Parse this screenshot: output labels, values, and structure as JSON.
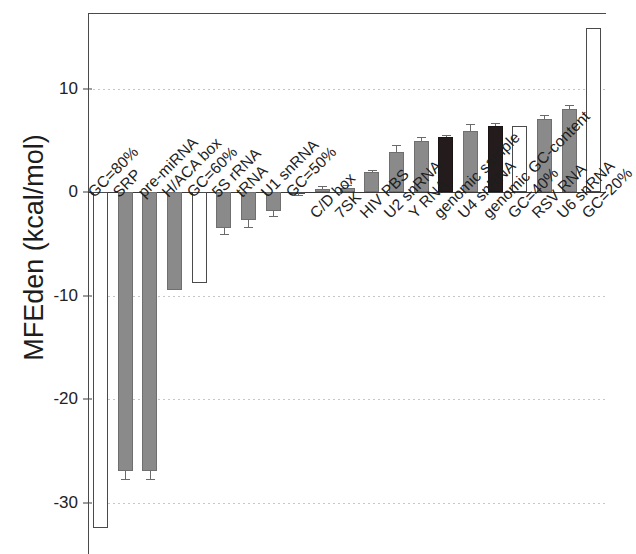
{
  "chart_data": {
    "type": "bar",
    "title": "",
    "xlabel": "",
    "ylabel": "MFEden (kcal/mol)",
    "ylim": [
      -34.5,
      17.4
    ],
    "yticks": [
      10,
      0,
      -10,
      -20,
      -30
    ],
    "ytick_labels": [
      "10",
      "0",
      "-10",
      "-20",
      "-30"
    ],
    "grid": "horizontal dotted gridlines at y ticks",
    "legend": "none",
    "bar_fill_colors": {
      "grey": "#8a8a8a",
      "black": "#241c1c",
      "white": "#ffffff"
    },
    "categories": [
      "GC=80%",
      "SRP",
      "pre-miRNA",
      "H/ACA box",
      "GC=60%",
      "5S rRNA",
      "tRNA",
      "U1 snRNA",
      "GC=50%",
      "C/D box",
      "7SK",
      "HIV PBS",
      "U2 snRNA",
      "Y RNA",
      "genomic sample",
      "U4 snRNA",
      "genomic GC-content",
      "GC=40%",
      "RSV RNA",
      "U6 snRNA",
      "GC=20%"
    ],
    "values": [
      -32.5,
      -27.0,
      -27.0,
      -9.5,
      -8.8,
      -3.5,
      -2.7,
      -1.8,
      -0.1,
      0.3,
      0.4,
      1.9,
      3.9,
      4.9,
      5.3,
      5.9,
      6.4,
      6.4,
      7.1,
      8.0,
      15.8
    ],
    "errors": [
      0,
      0.7,
      0.7,
      0,
      0,
      0.6,
      0.7,
      0.5,
      0.15,
      0.3,
      0.3,
      0.25,
      0.6,
      0.4,
      0.25,
      0.7,
      0.3,
      0,
      0.35,
      0.45,
      0
    ],
    "fills": [
      "white",
      "grey",
      "grey",
      "grey",
      "white",
      "grey",
      "grey",
      "grey",
      "white",
      "grey",
      "grey",
      "grey",
      "grey",
      "grey",
      "black",
      "grey",
      "black",
      "white",
      "grey",
      "grey",
      "white"
    ]
  },
  "axis": {
    "y_title": "MFEden (kcal/mol)"
  }
}
